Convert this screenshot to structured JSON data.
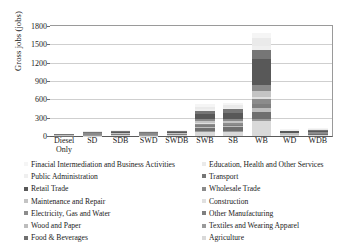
{
  "chart_data": {
    "type": "bar",
    "stacked": true,
    "title": "",
    "xlabel": "",
    "ylabel": "Gross jobs (jobs)",
    "ylim": [
      0,
      1800
    ],
    "yticks": [
      0,
      300,
      600,
      900,
      1200,
      1500,
      1800
    ],
    "grid": true,
    "legend_position": "bottom",
    "categories": [
      "Diesel Only",
      "SD",
      "SDB",
      "SWD",
      "SWDB",
      "SWB",
      "SB",
      "WB",
      "WD",
      "WDB"
    ],
    "series": [
      {
        "name": "Agriculture",
        "color": "#d9d9d9",
        "values": [
          0,
          8,
          10,
          8,
          10,
          66,
          70,
          250,
          12,
          14
        ]
      },
      {
        "name": "Textiles and Wearing Apparel",
        "color": "#9a9a9a",
        "values": [
          0,
          2,
          2,
          2,
          2,
          10,
          10,
          30,
          3,
          3
        ]
      },
      {
        "name": "Food & Beverages",
        "color": "#6f6f6f",
        "values": [
          2,
          6,
          7,
          6,
          7,
          60,
          62,
          115,
          8,
          9
        ]
      },
      {
        "name": "Wood and Paper",
        "color": "#bdbdbd",
        "values": [
          1,
          3,
          4,
          3,
          4,
          18,
          18,
          60,
          4,
          5
        ]
      },
      {
        "name": "Other Manufacturing",
        "color": "#7f7f7f",
        "values": [
          2,
          4,
          5,
          4,
          5,
          22,
          22,
          75,
          5,
          6
        ]
      },
      {
        "name": "Electricity, Gas and Water",
        "color": "#8c8c8c",
        "values": [
          3,
          5,
          6,
          5,
          6,
          22,
          24,
          70,
          6,
          7
        ]
      },
      {
        "name": "Construction",
        "color": "#e0e0e0",
        "values": [
          1,
          3,
          3,
          3,
          3,
          14,
          14,
          45,
          4,
          4
        ]
      },
      {
        "name": "Maintenance and Repair",
        "color": "#c4c4c4",
        "values": [
          3,
          6,
          7,
          6,
          7,
          30,
          32,
          95,
          8,
          9
        ]
      },
      {
        "name": "Wholesale Trade",
        "color": "#8a8a8a",
        "values": [
          3,
          6,
          7,
          6,
          7,
          30,
          32,
          95,
          8,
          9
        ]
      },
      {
        "name": "Retail Trade",
        "color": "#585858",
        "values": [
          10,
          14,
          16,
          14,
          16,
          95,
          100,
          420,
          18,
          20
        ]
      },
      {
        "name": "Transport",
        "color": "#767676",
        "values": [
          6,
          9,
          10,
          9,
          10,
          50,
          52,
          150,
          11,
          12
        ]
      },
      {
        "name": "Public Administration",
        "color": "#efefef",
        "values": [
          2,
          4,
          4,
          4,
          4,
          20,
          20,
          75,
          5,
          6
        ]
      },
      {
        "name": "Education, Health and Other Services",
        "color": "#eaeaea",
        "values": [
          5,
          8,
          9,
          8,
          9,
          45,
          46,
          120,
          10,
          11
        ]
      },
      {
        "name": "Finacial Intermediation and Business Activities",
        "color": "#f5f5f5",
        "values": [
          4,
          7,
          8,
          7,
          8,
          38,
          40,
          90,
          9,
          10
        ]
      }
    ],
    "legend_left": [
      "Finacial Intermediation and Business Activities",
      "Public Administration",
      "Retail Trade",
      "Maintenance and Repair",
      "Electricity, Gas and Water",
      "Wood and Paper",
      "Food & Beverages"
    ],
    "legend_right": [
      "Education, Health and Other Services",
      "Transport",
      "Wholesale Trade",
      "Construction",
      "Other Manufacturing",
      "Textiles and Wearing Apparel",
      "Agriculture"
    ],
    "legend_left_colors": [
      "#f5f5f5",
      "#efefef",
      "#585858",
      "#c4c4c4",
      "#8c8c8c",
      "#bdbdbd",
      "#6f6f6f"
    ],
    "legend_right_colors": [
      "#eaeaea",
      "#767676",
      "#8a8a8a",
      "#e0e0e0",
      "#7f7f7f",
      "#9a9a9a",
      "#d9d9d9"
    ]
  }
}
